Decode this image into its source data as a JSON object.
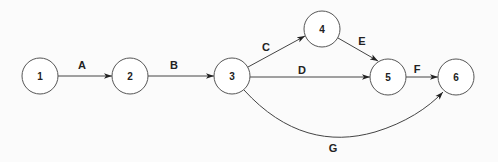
{
  "diagram": {
    "type": "activity-on-arrow network",
    "nodes": [
      {
        "id": "1",
        "label": "1",
        "x": 40,
        "y": 76
      },
      {
        "id": "2",
        "label": "2",
        "x": 130,
        "y": 76
      },
      {
        "id": "3",
        "label": "3",
        "x": 232,
        "y": 76
      },
      {
        "id": "4",
        "label": "4",
        "x": 322,
        "y": 29
      },
      {
        "id": "5",
        "label": "5",
        "x": 388,
        "y": 77
      },
      {
        "id": "6",
        "label": "6",
        "x": 456,
        "y": 77
      }
    ],
    "edges": [
      {
        "label": "A",
        "from": "1",
        "to": "2"
      },
      {
        "label": "B",
        "from": "2",
        "to": "3"
      },
      {
        "label": "C",
        "from": "3",
        "to": "4"
      },
      {
        "label": "D",
        "from": "3",
        "to": "5"
      },
      {
        "label": "E",
        "from": "4",
        "to": "5"
      },
      {
        "label": "F",
        "from": "5",
        "to": "6"
      },
      {
        "label": "G",
        "from": "3",
        "to": "6",
        "curved": true
      }
    ],
    "colors": {
      "stroke": "#444444",
      "node_fill": "#ffffff",
      "text": "#222222"
    }
  }
}
